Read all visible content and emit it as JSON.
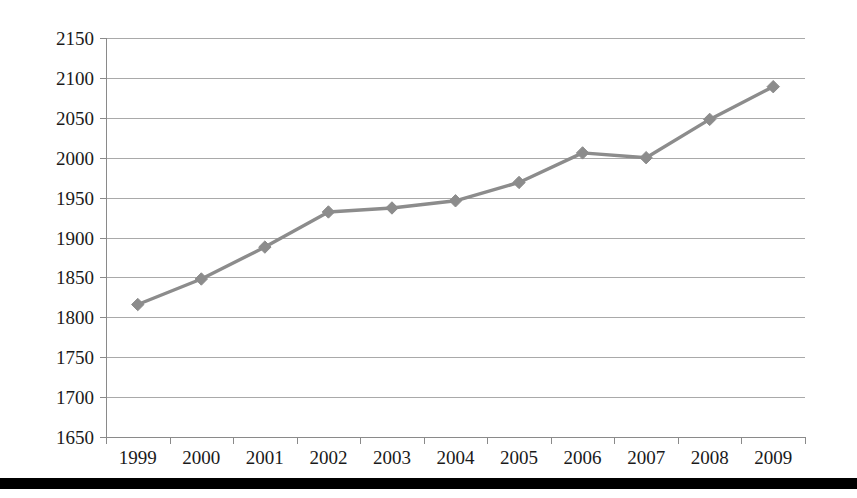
{
  "chart_data": {
    "type": "line",
    "title": "",
    "subtitle": "",
    "xlabel": "",
    "ylabel": "",
    "categories": [
      "1999",
      "2000",
      "2001",
      "2002",
      "2003",
      "2004",
      "2005",
      "2006",
      "2007",
      "2008",
      "2009"
    ],
    "series": [
      {
        "name": "",
        "values": [
          1816,
          1848,
          1888,
          1932,
          1937,
          1946,
          1969,
          2006,
          2000,
          2048,
          2089
        ]
      }
    ],
    "ylim": [
      1650,
      2150
    ],
    "ytick_step": 50,
    "ytick_labels": [
      "2150",
      "2100",
      "2050",
      "2000",
      "1950",
      "1900",
      "1850",
      "1800",
      "1750",
      "1700",
      "1650"
    ],
    "grid": true,
    "grid_axis": "y",
    "legend": false,
    "legend_position": "none",
    "marker": "diamond",
    "colors": {
      "line": "#8c8c8c",
      "marker": "#8c8c8c",
      "grid": "#a9a9a9",
      "axis": "#8a8a8a",
      "text": "#1a1a1a",
      "background": "#ffffff",
      "footer_bar": "#000000"
    }
  },
  "figure": {
    "footer_bar_visible": true
  }
}
